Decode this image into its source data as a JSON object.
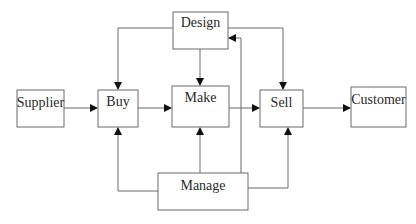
{
  "diagram": {
    "type": "flow",
    "nodes": [
      {
        "id": "design",
        "label": "Design",
        "x": 173,
        "y": 12,
        "w": 55,
        "h": 37
      },
      {
        "id": "supplier",
        "label": "Supplier",
        "x": 17,
        "y": 90,
        "w": 47,
        "h": 37
      },
      {
        "id": "buy",
        "label": "Buy",
        "x": 98,
        "y": 90,
        "w": 40,
        "h": 37
      },
      {
        "id": "make",
        "label": "Make",
        "x": 172,
        "y": 86,
        "w": 57,
        "h": 41
      },
      {
        "id": "sell",
        "label": "Sell",
        "x": 260,
        "y": 90,
        "w": 43,
        "h": 37
      },
      {
        "id": "customer",
        "label": "Customer",
        "x": 351,
        "y": 87,
        "w": 55,
        "h": 40
      },
      {
        "id": "manage",
        "label": "Manage",
        "x": 158,
        "y": 173,
        "w": 90,
        "h": 37
      }
    ],
    "edges": [
      {
        "from": "supplier",
        "to": "buy"
      },
      {
        "from": "buy",
        "to": "make"
      },
      {
        "from": "make",
        "to": "sell"
      },
      {
        "from": "sell",
        "to": "customer"
      },
      {
        "from": "design",
        "to": "buy"
      },
      {
        "from": "design",
        "to": "make"
      },
      {
        "from": "design",
        "to": "sell"
      },
      {
        "from": "manage",
        "to": "buy"
      },
      {
        "from": "manage",
        "to": "make"
      },
      {
        "from": "manage",
        "to": "sell"
      },
      {
        "from": "manage",
        "to": "design"
      }
    ]
  }
}
